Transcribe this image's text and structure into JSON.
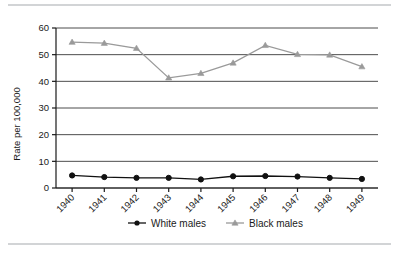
{
  "chart_data": {
    "type": "line",
    "title": "",
    "xlabel": "",
    "ylabel": "Rate per 100,000",
    "categories": [
      "1940",
      "1941",
      "1942",
      "1943",
      "1944",
      "1945",
      "1946",
      "1947",
      "1948",
      "1949"
    ],
    "x": [
      1940,
      1941,
      1942,
      1943,
      1944,
      1945,
      1946,
      1947,
      1948,
      1949
    ],
    "ylim": [
      0,
      60
    ],
    "yticks": [
      0,
      10,
      20,
      30,
      40,
      50,
      60
    ],
    "ytick_labels": [
      "0",
      "10",
      "20",
      "30",
      "40",
      "50",
      "60"
    ],
    "grid": "horizontal",
    "legend_position": "bottom-center",
    "series": [
      {
        "name": "White males",
        "color": "#111111",
        "marker": "circle",
        "values": [
          4.7,
          4.1,
          3.8,
          3.8,
          3.2,
          4.4,
          4.5,
          4.3,
          3.8,
          3.4
        ]
      },
      {
        "name": "Black males",
        "color": "#9a9a9a",
        "marker": "triangle",
        "values": [
          54.7,
          54.3,
          52.4,
          41.3,
          43.0,
          46.9,
          53.5,
          50.1,
          49.9,
          45.5
        ]
      }
    ]
  },
  "axes": {
    "y_axis_title": "Rate per 100,000"
  },
  "legend": {
    "items": [
      {
        "label": "White males",
        "color": "#111111",
        "marker": "circle"
      },
      {
        "label": "Black males",
        "color": "#9a9a9a",
        "marker": "triangle"
      }
    ]
  },
  "colors": {
    "white_males": "#111111",
    "black_males": "#9a9a9a",
    "gridline": "#4d4d4d",
    "axis": "#1a1a1a",
    "rule": "#d2d4d6",
    "background": "#ffffff"
  }
}
